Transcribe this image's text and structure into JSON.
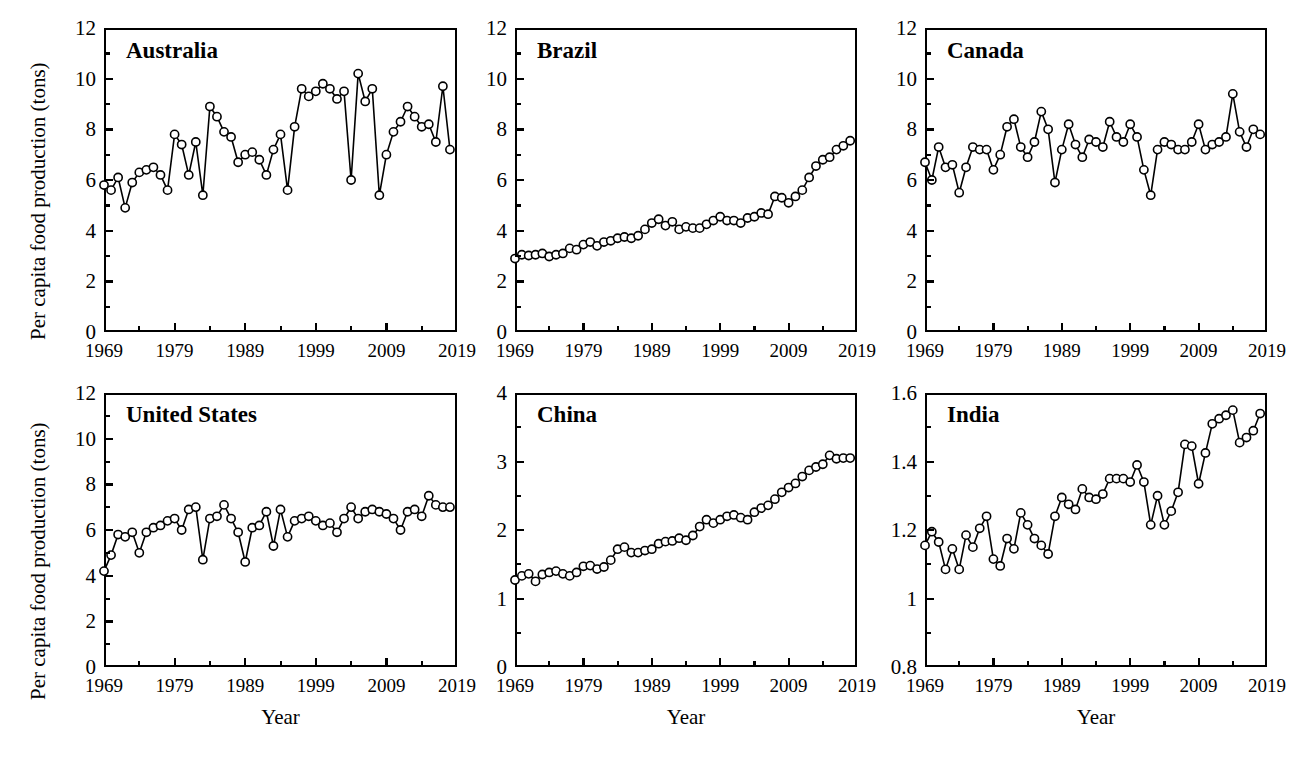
{
  "figure": {
    "ylabel": "Per capita food production (tons)",
    "xlabel": "Year",
    "marker": "open-circle",
    "line_color": "#000000",
    "marker_fill": "#ffffff",
    "background": "#ffffff"
  },
  "chart_data": [
    {
      "type": "line",
      "title": "Australia",
      "xlabel": "Year",
      "ylabel": "Per capita food production (tons)",
      "xlim": [
        1969,
        2019
      ],
      "ylim": [
        0,
        12
      ],
      "xticks": [
        "1969",
        "1979",
        "1989",
        "1999",
        "2009",
        "2019"
      ],
      "yticks": [
        "0",
        "2",
        "4",
        "6",
        "8",
        "10",
        "12"
      ],
      "grid": false,
      "legend": "none",
      "x": [
        1969,
        1970,
        1971,
        1972,
        1973,
        1974,
        1975,
        1976,
        1977,
        1978,
        1979,
        1980,
        1981,
        1982,
        1983,
        1984,
        1985,
        1986,
        1987,
        1988,
        1989,
        1990,
        1991,
        1992,
        1993,
        1994,
        1995,
        1996,
        1997,
        1998,
        1999,
        2000,
        2001,
        2002,
        2003,
        2004,
        2005,
        2006,
        2007,
        2008,
        2009,
        2010,
        2011,
        2012,
        2013,
        2014,
        2015,
        2016,
        2017,
        2018
      ],
      "values": [
        5.8,
        5.6,
        6.1,
        4.9,
        5.9,
        6.3,
        6.4,
        6.5,
        6.2,
        5.6,
        7.8,
        7.4,
        6.2,
        7.5,
        5.4,
        8.9,
        8.5,
        7.9,
        7.7,
        6.7,
        7.0,
        7.1,
        6.8,
        6.2,
        7.2,
        7.8,
        5.6,
        8.1,
        9.6,
        9.3,
        9.5,
        9.8,
        9.6,
        9.2,
        9.5,
        6.0,
        10.2,
        9.1,
        9.6,
        5.4,
        7.0,
        7.9,
        8.3,
        8.9,
        8.5,
        8.1,
        8.2,
        7.5,
        9.7,
        7.2
      ]
    },
    {
      "type": "line",
      "title": "Brazil",
      "xlabel": "Year",
      "ylabel": "Per capita food production (tons)",
      "xlim": [
        1969,
        2019
      ],
      "ylim": [
        0,
        12
      ],
      "xticks": [
        "1969",
        "1979",
        "1989",
        "1999",
        "2009",
        "2019"
      ],
      "yticks": [
        "0",
        "2",
        "4",
        "6",
        "8",
        "10",
        "12"
      ],
      "grid": false,
      "legend": "none",
      "x": [
        1969,
        1970,
        1971,
        1972,
        1973,
        1974,
        1975,
        1976,
        1977,
        1978,
        1979,
        1980,
        1981,
        1982,
        1983,
        1984,
        1985,
        1986,
        1987,
        1988,
        1989,
        1990,
        1991,
        1992,
        1993,
        1994,
        1995,
        1996,
        1997,
        1998,
        1999,
        2000,
        2001,
        2002,
        2003,
        2004,
        2005,
        2006,
        2007,
        2008,
        2009,
        2010,
        2011,
        2012,
        2013,
        2014,
        2015,
        2016,
        2017,
        2018
      ],
      "values": [
        2.9,
        3.05,
        3.02,
        3.05,
        3.1,
        2.98,
        3.05,
        3.1,
        3.3,
        3.25,
        3.45,
        3.55,
        3.4,
        3.55,
        3.6,
        3.7,
        3.75,
        3.7,
        3.8,
        4.05,
        4.3,
        4.45,
        4.2,
        4.35,
        4.05,
        4.15,
        4.1,
        4.1,
        4.25,
        4.4,
        4.55,
        4.4,
        4.4,
        4.3,
        4.5,
        4.55,
        4.7,
        4.65,
        5.35,
        5.3,
        5.1,
        5.35,
        5.6,
        6.1,
        6.55,
        6.8,
        6.9,
        7.2,
        7.35,
        7.55
      ]
    },
    {
      "type": "line",
      "title": "Canada",
      "xlabel": "Year",
      "ylabel": "Per capita food production (tons)",
      "xlim": [
        1969,
        2019
      ],
      "ylim": [
        0,
        12
      ],
      "xticks": [
        "1969",
        "1979",
        "1989",
        "1999",
        "2009",
        "2019"
      ],
      "yticks": [
        "0",
        "2",
        "4",
        "6",
        "8",
        "10",
        "12"
      ],
      "grid": false,
      "legend": "none",
      "x": [
        1969,
        1970,
        1971,
        1972,
        1973,
        1974,
        1975,
        1976,
        1977,
        1978,
        1979,
        1980,
        1981,
        1982,
        1983,
        1984,
        1985,
        1986,
        1987,
        1988,
        1989,
        1990,
        1991,
        1992,
        1993,
        1994,
        1995,
        1996,
        1997,
        1998,
        1999,
        2000,
        2001,
        2002,
        2003,
        2004,
        2005,
        2006,
        2007,
        2008,
        2009,
        2010,
        2011,
        2012,
        2013,
        2014,
        2015,
        2016,
        2017,
        2018
      ],
      "values": [
        6.7,
        6.0,
        7.3,
        6.5,
        6.6,
        5.5,
        6.5,
        7.3,
        7.2,
        7.2,
        6.4,
        7.0,
        8.1,
        8.4,
        7.3,
        6.9,
        7.5,
        8.7,
        8.0,
        5.9,
        7.2,
        8.2,
        7.4,
        6.9,
        7.6,
        7.5,
        7.3,
        8.3,
        7.7,
        7.5,
        8.2,
        7.7,
        6.4,
        5.4,
        7.2,
        7.5,
        7.4,
        7.2,
        7.2,
        7.5,
        8.2,
        7.2,
        7.4,
        7.5,
        7.7,
        9.4,
        7.9,
        7.3,
        8.0,
        7.8
      ]
    },
    {
      "type": "line",
      "title": "United States",
      "xlabel": "Year",
      "ylabel": "Per capita food production (tons)",
      "xlim": [
        1969,
        2019
      ],
      "ylim": [
        0,
        12
      ],
      "xticks": [
        "1969",
        "1979",
        "1989",
        "1999",
        "2009",
        "2019"
      ],
      "yticks": [
        "0",
        "2",
        "4",
        "6",
        "8",
        "10",
        "12"
      ],
      "grid": false,
      "legend": "none",
      "x": [
        1969,
        1970,
        1971,
        1972,
        1973,
        1974,
        1975,
        1976,
        1977,
        1978,
        1979,
        1980,
        1981,
        1982,
        1983,
        1984,
        1985,
        1986,
        1987,
        1988,
        1989,
        1990,
        1991,
        1992,
        1993,
        1994,
        1995,
        1996,
        1997,
        1998,
        1999,
        2000,
        2001,
        2002,
        2003,
        2004,
        2005,
        2006,
        2007,
        2008,
        2009,
        2010,
        2011,
        2012,
        2013,
        2014,
        2015,
        2016,
        2017,
        2018
      ],
      "values": [
        4.2,
        4.9,
        5.8,
        5.7,
        5.9,
        5.0,
        5.9,
        6.1,
        6.2,
        6.4,
        6.5,
        6.0,
        6.9,
        7.0,
        4.7,
        6.5,
        6.6,
        7.1,
        6.5,
        5.9,
        4.6,
        6.1,
        6.2,
        6.8,
        5.3,
        6.9,
        5.7,
        6.4,
        6.5,
        6.6,
        6.4,
        6.2,
        6.3,
        5.9,
        6.5,
        7.0,
        6.5,
        6.8,
        6.9,
        6.8,
        6.7,
        6.5,
        6.0,
        6.8,
        6.9,
        6.6,
        7.5,
        7.1,
        7.0,
        7.0
      ]
    },
    {
      "type": "line",
      "title": "China",
      "xlabel": "Year",
      "ylabel": "Per capita food production (tons)",
      "xlim": [
        1969,
        2019
      ],
      "ylim": [
        0,
        4
      ],
      "xticks": [
        "1969",
        "1979",
        "1989",
        "1999",
        "2009",
        "2019"
      ],
      "yticks": [
        "0",
        "1",
        "2",
        "3",
        "4"
      ],
      "grid": false,
      "legend": "none",
      "x": [
        1969,
        1970,
        1971,
        1972,
        1973,
        1974,
        1975,
        1976,
        1977,
        1978,
        1979,
        1980,
        1981,
        1982,
        1983,
        1984,
        1985,
        1986,
        1987,
        1988,
        1989,
        1990,
        1991,
        1992,
        1993,
        1994,
        1995,
        1996,
        1997,
        1998,
        1999,
        2000,
        2001,
        2002,
        2003,
        2004,
        2005,
        2006,
        2007,
        2008,
        2009,
        2010,
        2011,
        2012,
        2013,
        2014,
        2015,
        2016,
        2017,
        2018
      ],
      "values": [
        1.27,
        1.33,
        1.36,
        1.25,
        1.35,
        1.38,
        1.4,
        1.36,
        1.33,
        1.38,
        1.47,
        1.48,
        1.43,
        1.46,
        1.56,
        1.72,
        1.75,
        1.67,
        1.67,
        1.7,
        1.72,
        1.8,
        1.83,
        1.84,
        1.88,
        1.85,
        1.92,
        2.05,
        2.15,
        2.1,
        2.15,
        2.2,
        2.22,
        2.18,
        2.15,
        2.26,
        2.32,
        2.36,
        2.45,
        2.55,
        2.62,
        2.68,
        2.78,
        2.87,
        2.92,
        2.96,
        3.09,
        3.04,
        3.05,
        3.05
      ]
    },
    {
      "type": "line",
      "title": "India",
      "xlabel": "Year",
      "ylabel": "Per capita food production (tons)",
      "xlim": [
        1969,
        2019
      ],
      "ylim": [
        0.8,
        1.6
      ],
      "xticks": [
        "1969",
        "1979",
        "1989",
        "1999",
        "2009",
        "2019"
      ],
      "yticks": [
        "0.8",
        "1",
        "1.2",
        "1.4",
        "1.6"
      ],
      "grid": false,
      "legend": "none",
      "x": [
        1969,
        1970,
        1971,
        1972,
        1973,
        1974,
        1975,
        1976,
        1977,
        1978,
        1979,
        1980,
        1981,
        1982,
        1983,
        1984,
        1985,
        1986,
        1987,
        1988,
        1989,
        1990,
        1991,
        1992,
        1993,
        1994,
        1995,
        1996,
        1997,
        1998,
        1999,
        2000,
        2001,
        2002,
        2003,
        2004,
        2005,
        2006,
        2007,
        2008,
        2009,
        2010,
        2011,
        2012,
        2013,
        2014,
        2015,
        2016,
        2017,
        2018
      ],
      "values": [
        1.155,
        1.195,
        1.165,
        1.085,
        1.145,
        1.085,
        1.185,
        1.15,
        1.205,
        1.24,
        1.115,
        1.095,
        1.175,
        1.145,
        1.25,
        1.215,
        1.175,
        1.155,
        1.13,
        1.24,
        1.295,
        1.275,
        1.26,
        1.32,
        1.295,
        1.29,
        1.305,
        1.35,
        1.35,
        1.35,
        1.34,
        1.39,
        1.34,
        1.215,
        1.3,
        1.215,
        1.255,
        1.31,
        1.45,
        1.445,
        1.335,
        1.425,
        1.51,
        1.525,
        1.535,
        1.55,
        1.455,
        1.47,
        1.49,
        1.54
      ]
    }
  ]
}
